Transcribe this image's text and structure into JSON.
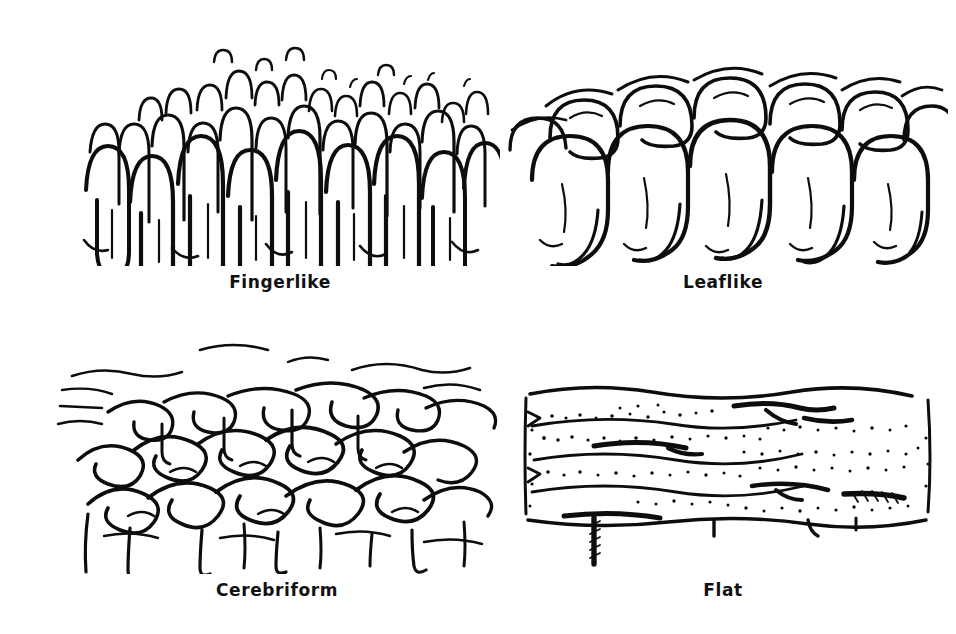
{
  "figure": {
    "background_color": "#ffffff",
    "ink_color": "#0d0d0d",
    "layout": "2x2 grid of line-drawing panels, each with a centered caption beneath",
    "panels": [
      {
        "id": "fingerlike",
        "caption": "Fingerlike",
        "art_name": "fingerlike-villi-drawing",
        "description": "Dense field of tall narrow finger-shaped villous projections of varying heights"
      },
      {
        "id": "leaflike",
        "caption": "Leaflike",
        "art_name": "leaflike-villi-drawing",
        "description": "Broad flattened leaf-shaped villi with rounded tops and splayed bases"
      },
      {
        "id": "cerebriform",
        "caption": "Cerebriform",
        "art_name": "cerebriform-villi-drawing",
        "description": "Convoluted brain-like winding ridges and grooves"
      },
      {
        "id": "flat",
        "caption": "Flat",
        "art_name": "flat-mucosa-drawing",
        "description": "Flattened mucosal slab with horizontal ridges, stippled texture and hatched crypt openings"
      }
    ]
  }
}
